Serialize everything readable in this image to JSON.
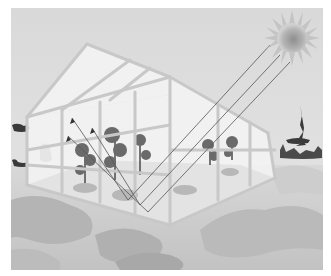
{
  "illustration": {
    "subject": "greenhouse",
    "description": "Glass greenhouse with plants inside; sun rays enter through the glass roof and reflect from the floor",
    "elements": [
      "sun",
      "sun-rays",
      "greenhouse-frame",
      "plants",
      "floor",
      "background-trees",
      "ground"
    ]
  },
  "colors": {
    "sky": "#d6d6d6",
    "sky_light": "#ececec",
    "sun_core": "#9a9a9a",
    "frame": "#cfcfcf",
    "glass": "#f7f7f7",
    "floor": "#7a7a7a",
    "ground": "#c8c8c8",
    "ground_dark": "#a9a9a9",
    "ray": "#555555",
    "tree_dark": "#3a3a3a"
  }
}
